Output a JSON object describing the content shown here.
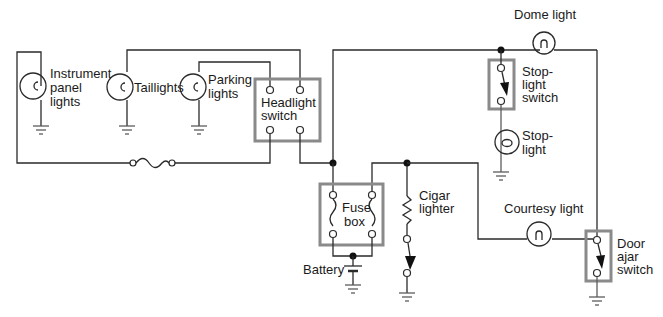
{
  "diagram": {
    "type": "automotive lighting wiring schematic",
    "components": {
      "instrument_panel_lights": {
        "lines": [
          "Instrument",
          "panel",
          "lights"
        ]
      },
      "taillights": {
        "label": "Taillights"
      },
      "parking_lights": {
        "lines": [
          "Parking",
          "lights"
        ]
      },
      "headlight_switch": {
        "lines": [
          "Headlight",
          "switch"
        ]
      },
      "dome_light": {
        "label": "Dome light"
      },
      "stop_light_switch": {
        "lines": [
          "Stop-",
          "light",
          "switch"
        ]
      },
      "stop_light": {
        "lines": [
          "Stop-",
          "light"
        ]
      },
      "fuse_box": {
        "lines": [
          "Fuse",
          "box"
        ]
      },
      "cigar_lighter": {
        "lines": [
          "Cigar",
          "lighter"
        ]
      },
      "battery": {
        "label": "Battery"
      },
      "courtesy_light": {
        "label": "Courtesy light"
      },
      "door_ajar_switch": {
        "lines": [
          "Door",
          "ajar",
          "switch"
        ]
      }
    },
    "colors": {
      "wire": "#2a2a2a",
      "component_box": "#8a8a8a",
      "background": "#ffffff"
    }
  }
}
